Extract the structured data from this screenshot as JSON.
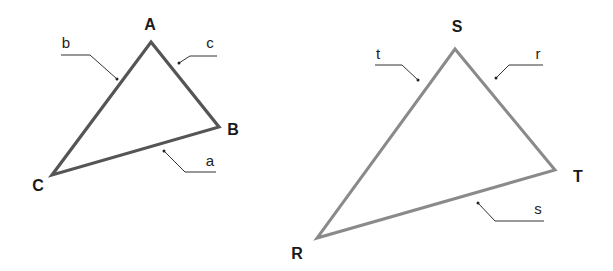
{
  "diagram": {
    "triangles": [
      {
        "name": "ABC",
        "stroke_color": "#555555",
        "vertices": [
          {
            "label": "A",
            "x": 151,
            "y": 42,
            "label_x": 150,
            "label_y": 25
          },
          {
            "label": "B",
            "x": 219,
            "y": 127,
            "label_x": 232,
            "label_y": 132
          },
          {
            "label": "C",
            "x": 52,
            "y": 175,
            "label_x": 37,
            "label_y": 188
          }
        ],
        "sides": [
          {
            "label": "b",
            "between": "A-C",
            "label_x": 66,
            "label_y": 46
          },
          {
            "label": "c",
            "between": "A-B",
            "label_x": 210,
            "label_y": 46
          },
          {
            "label": "a",
            "between": "B-C",
            "label_x": 210,
            "label_y": 165
          }
        ]
      },
      {
        "name": "RST",
        "stroke_color": "#8a8a8a",
        "vertices": [
          {
            "label": "S",
            "x": 455,
            "y": 49,
            "label_x": 457,
            "label_y": 30
          },
          {
            "label": "T",
            "x": 555,
            "y": 170,
            "label_x": 578,
            "label_y": 181
          },
          {
            "label": "R",
            "x": 317,
            "y": 238,
            "label_x": 297,
            "label_y": 258
          }
        ],
        "sides": [
          {
            "label": "t",
            "between": "S-R",
            "label_x": 377,
            "label_y": 57
          },
          {
            "label": "r",
            "between": "S-T",
            "label_x": 538,
            "label_y": 57
          },
          {
            "label": "s",
            "between": "R-T",
            "label_x": 538,
            "label_y": 212
          }
        ]
      }
    ]
  }
}
